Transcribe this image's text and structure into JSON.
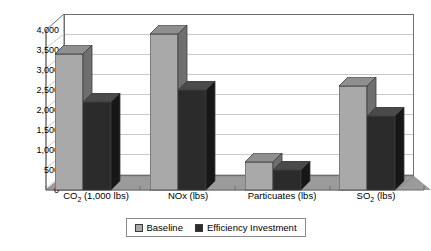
{
  "chart_data": {
    "type": "bar",
    "title": "",
    "subtitle": "",
    "xlabel": "",
    "ylabel": "",
    "categories": [
      "CO2 (1,000 lbs)",
      "NOx (lbs)",
      "Particuates (lbs)",
      "SO2 (lbs)"
    ],
    "series": [
      {
        "name": "Baseline",
        "values": [
          3400,
          3900,
          700,
          2600
        ],
        "color": "#a9a9a9"
      },
      {
        "name": "Efficiency Investment",
        "values": [
          2200,
          2500,
          500,
          1850
        ],
        "color": "#2b2b2b"
      }
    ],
    "ylim": [
      0,
      4000
    ],
    "ytick_values": [
      0,
      500,
      1000,
      1500,
      2000,
      2500,
      3000,
      3500,
      4000
    ],
    "ytick_labels": [
      "0",
      "500",
      "1,000",
      "1,500",
      "2,000",
      "2,500",
      "3,000",
      "3,500",
      "4,000"
    ],
    "grid": true,
    "grid_axis": "y",
    "legend_position": "bottom",
    "three_d": true
  },
  "categories_rich": [
    {
      "main": "CO",
      "sub": "2",
      "tail": " (1,000 lbs)"
    },
    {
      "main": "NOx",
      "sub": "",
      "tail": " (lbs)"
    },
    {
      "main": "Particuates",
      "sub": "",
      "tail": " (lbs)"
    },
    {
      "main": "SO",
      "sub": "2",
      "tail": " (lbs)"
    }
  ],
  "legend": {
    "items": [
      {
        "label": "Baseline",
        "color": "#a9a9a9"
      },
      {
        "label": "Efficiency Investment",
        "color": "#2b2b2b"
      }
    ]
  },
  "colors": {
    "baseline": "#a9a9a9",
    "baseline_top": "#8f8f8f",
    "baseline_side": "#6f6f6f",
    "efficiency": "#2b2b2b",
    "efficiency_top": "#4a4a4a",
    "efficiency_side": "#171717",
    "floor": "#9b9b9b",
    "wall": "#ffffff",
    "gridline": "#c9c9c9",
    "frame": "#6e6e6e",
    "plot_background": "#ffffff"
  }
}
